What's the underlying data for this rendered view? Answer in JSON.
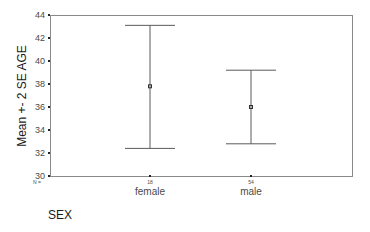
{
  "chart_data": {
    "type": "errorbar",
    "title": "",
    "xlabel": "SEX",
    "ylabel": "Mean +- 2 SE AGE",
    "categories": [
      "female",
      "male"
    ],
    "n_label": "N =",
    "n": [
      "18",
      "54"
    ],
    "series": [
      {
        "name": "AGE",
        "mean": [
          37.8,
          36.0
        ],
        "upper": [
          43.1,
          39.2
        ],
        "lower": [
          32.4,
          32.8
        ]
      }
    ],
    "ylim": [
      30,
      44
    ],
    "yticks": [
      30,
      32,
      34,
      36,
      38,
      40,
      42,
      44
    ],
    "grid": false,
    "legend": null
  },
  "colors": {
    "frame": "#808080",
    "bars": "#5a5a5a",
    "text": "#4a4a4a"
  }
}
